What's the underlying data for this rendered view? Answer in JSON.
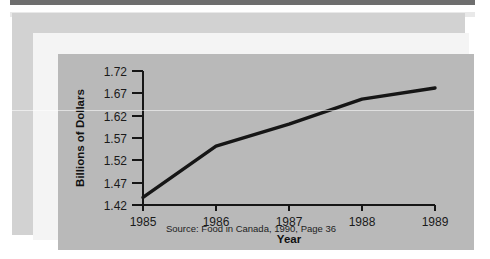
{
  "figure": {
    "source_note": "Source: Food in Canada, 1990, Page 36",
    "colors": {
      "page_background": "#ffffff",
      "panel_background": "#d2d2d2",
      "frame_background": "#f4f4f4",
      "plot_background": "#b9b9b9",
      "line_color": "#161616",
      "axis_color": "#161616",
      "top_rule": "#6e6e6e"
    }
  },
  "chart_data": {
    "type": "line",
    "title": "",
    "xlabel": "Year",
    "ylabel": "Billions of Dollars",
    "categories": [
      "1985",
      "1986",
      "1987",
      "1988",
      "1989"
    ],
    "x": [
      1985,
      1986,
      1987,
      1988,
      1989
    ],
    "values": [
      1.437,
      1.552,
      1.601,
      1.657,
      1.682
    ],
    "series": [
      {
        "name": "Billions of Dollars",
        "values": [
          1.437,
          1.552,
          1.601,
          1.657,
          1.682
        ]
      }
    ],
    "xlim": [
      1985,
      1989
    ],
    "ylim": [
      1.42,
      1.72
    ],
    "yticks": [
      1.42,
      1.47,
      1.52,
      1.57,
      1.62,
      1.67,
      1.72
    ],
    "ytick_labels": [
      "1.42",
      "1.47",
      "1.52",
      "1.57",
      "1.62",
      "1.67",
      "1.72"
    ],
    "xtick_labels": [
      "1985",
      "1986",
      "1987",
      "1988",
      "1989"
    ],
    "grid": false,
    "legend": false,
    "legend_position": "none",
    "annotations": [
      "Source: Food in Canada, 1990, Page 36"
    ]
  }
}
